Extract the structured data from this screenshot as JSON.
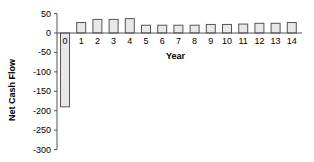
{
  "chart_data": {
    "type": "bar",
    "title": "",
    "xlabel": "Year",
    "ylabel": "Net Cash Flow",
    "ylim": [
      -300,
      50
    ],
    "yticks": [
      50,
      0,
      -50,
      -100,
      -150,
      -200,
      -250,
      -300
    ],
    "categories": [
      "0",
      "1",
      "2",
      "3",
      "4",
      "5",
      "6",
      "7",
      "8",
      "9",
      "10",
      "11",
      "12",
      "13",
      "14"
    ],
    "values": [
      -190,
      27,
      35,
      35,
      37,
      20,
      20,
      20,
      20,
      22,
      22,
      23,
      25,
      25,
      27
    ],
    "grid": false,
    "legend": null,
    "colors": {
      "bar_fill": "#e8e8e8",
      "bar_stroke": "#555555",
      "axis": "#555555"
    }
  }
}
